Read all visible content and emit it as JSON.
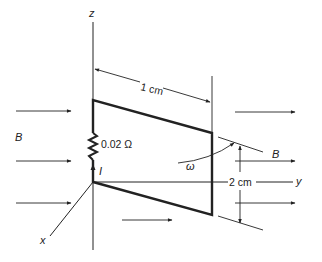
{
  "diagram": {
    "axes": {
      "z_label": "z",
      "y_label": "y",
      "x_label": "x"
    },
    "field": {
      "left_label": "B",
      "right_label": "B"
    },
    "resistor": {
      "label": "0.02 Ω"
    },
    "current": {
      "label": "I"
    },
    "rotation": {
      "label": "ω"
    },
    "dimensions": {
      "width_label": "1 cm",
      "height_label": "2 cm"
    },
    "colors": {
      "line": "#222222",
      "background": "#ffffff"
    }
  }
}
